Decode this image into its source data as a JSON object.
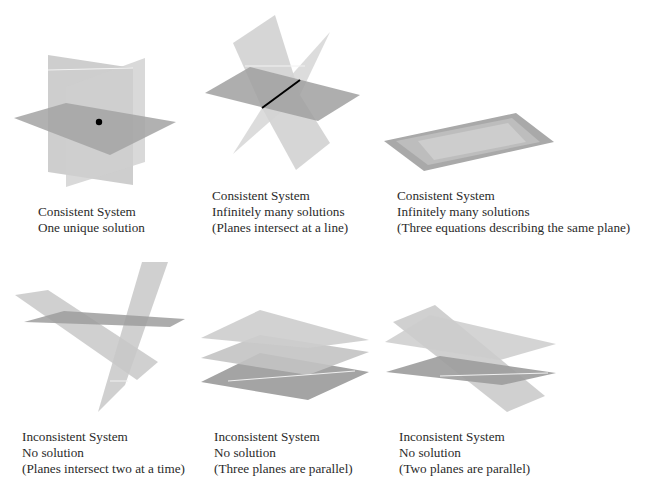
{
  "panels": [
    {
      "id": "one-unique-solution",
      "lines": [
        "Consistent System",
        "One unique solution"
      ]
    },
    {
      "id": "planes-intersect-line",
      "lines": [
        "Consistent System",
        "Infinitely many solutions",
        "(Planes intersect at a line)"
      ]
    },
    {
      "id": "same-plane",
      "lines": [
        "Consistent System",
        "Infinitely many solutions",
        "(Three equations describing the same plane)"
      ]
    },
    {
      "id": "intersect-two-at-a-time",
      "lines": [
        "Inconsistent System",
        "No solution",
        "(Planes intersect two at a time)"
      ]
    },
    {
      "id": "three-parallel",
      "lines": [
        "Inconsistent System",
        "No solution",
        "(Three planes are parallel)"
      ]
    },
    {
      "id": "two-parallel",
      "lines": [
        "Inconsistent System",
        "No solution",
        "(Two planes are parallel)"
      ]
    }
  ],
  "colors": {
    "plane_light": "#cfcfcf",
    "plane_mid": "#b8b8b8",
    "plane_dark": "#9a9a9a",
    "intersection": "#000000",
    "background": "#ffffff"
  }
}
